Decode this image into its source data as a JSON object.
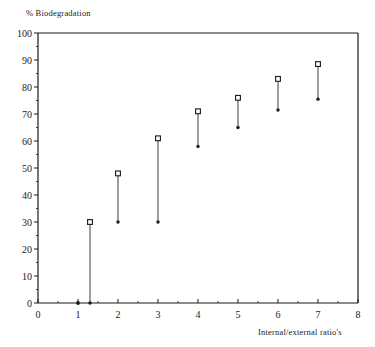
{
  "chart_data": {
    "type": "scatter",
    "title": "",
    "ylabel": "% Biodegradation",
    "xlabel": "Internal/external ratio's",
    "xlim": [
      0,
      8
    ],
    "ylim": [
      0,
      100
    ],
    "xticks": [
      0,
      1,
      2,
      3,
      4,
      5,
      6,
      7,
      8
    ],
    "xtick_labels": [
      "0",
      "1",
      "2",
      "3",
      "4",
      "5",
      "6",
      "7",
      "8"
    ],
    "yticks": [
      0,
      10,
      20,
      30,
      40,
      50,
      60,
      70,
      80,
      90,
      100
    ],
    "ytick_labels": [
      "0",
      "10",
      "20",
      "30",
      "40",
      "50",
      "60",
      "70",
      "80",
      "90",
      "100"
    ],
    "y_minor_tick_step": 5,
    "grid": false,
    "legend": "none",
    "frame": "box",
    "marker_top": "open-square",
    "marker_bottom": "filled-dot",
    "series": [
      {
        "name": "upper value (open square)",
        "x": [
          1.0,
          1.3,
          2.0,
          3.0,
          4.0,
          5.0,
          6.0,
          7.0
        ],
        "values": [
          0,
          30,
          48,
          61,
          71,
          76,
          83,
          88.5
        ]
      },
      {
        "name": "lower value (filled dot)",
        "x": [
          1.0,
          1.3,
          2.0,
          3.0,
          4.0,
          5.0,
          6.0,
          7.0
        ],
        "values": [
          0,
          0,
          30,
          47.5,
          58,
          65,
          71.5,
          75.5
        ]
      }
    ],
    "points": [
      {
        "x": 1.0,
        "top": 0,
        "bottom": 0
      },
      {
        "x": 1.3,
        "top": 30,
        "bottom": 0
      },
      {
        "x": 2.0,
        "top": 48,
        "bottom": 30
      },
      {
        "x": 3.0,
        "top": 61,
        "bottom": 30
      },
      {
        "x": 4.0,
        "top": 71,
        "bottom": 58
      },
      {
        "x": 5.0,
        "top": 76,
        "bottom": 65
      },
      {
        "x": 6.0,
        "top": 83,
        "bottom": 71.5
      },
      {
        "x": 7.0,
        "top": 88.5,
        "bottom": 75.5
      }
    ],
    "colors": {
      "axis": "#1a1a1a",
      "marker": "#1a1a1a",
      "line": "#4d4d4d",
      "background": "#ffffff"
    }
  }
}
